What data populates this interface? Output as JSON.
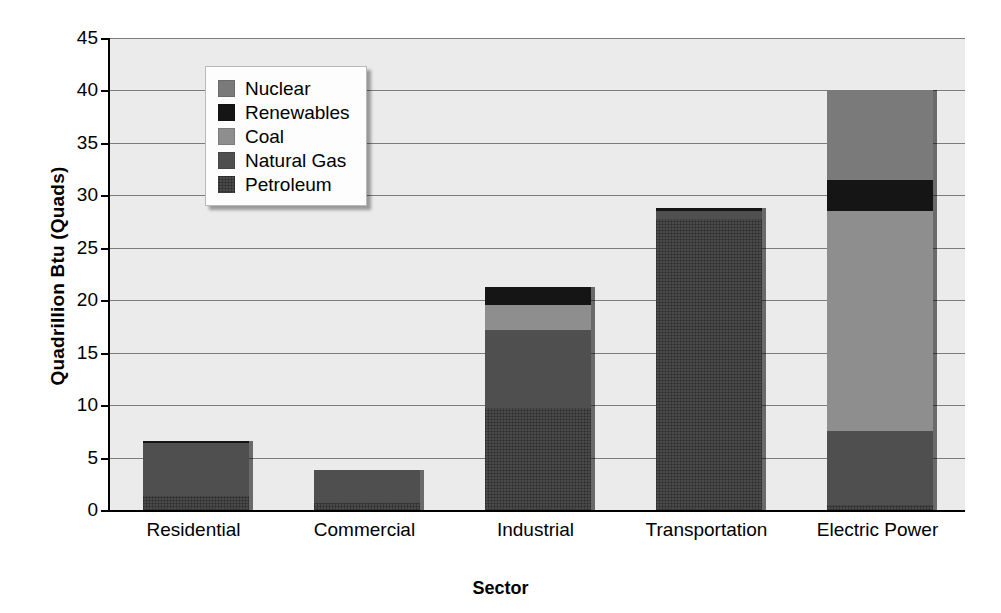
{
  "chart_data": {
    "type": "bar",
    "stacked": true,
    "title": "",
    "xlabel": "Sector",
    "ylabel": "Quadrillion Btu (Quads)",
    "ylim": [
      0,
      45
    ],
    "ytick_labels": [
      "45",
      "40",
      "35",
      "30",
      "25",
      "20",
      "15",
      "10",
      "5",
      "0"
    ],
    "ytick_values": [
      45,
      40,
      35,
      30,
      25,
      20,
      15,
      10,
      5,
      0
    ],
    "grid": "horizontal",
    "legend_position": "upper-left-inside",
    "categories": [
      "Residential",
      "Commercial",
      "Industrial",
      "Transportation",
      "Electric Power"
    ],
    "series": [
      {
        "name": "Petroleum",
        "color": "#4a4a4a",
        "values": [
          1.3,
          0.7,
          9.7,
          27.7,
          0.5
        ]
      },
      {
        "name": "Natural Gas",
        "color": "#4f4f4f",
        "values": [
          5.1,
          3.1,
          7.5,
          0.8,
          7.0
        ]
      },
      {
        "name": "Coal",
        "color": "#8e8e8e",
        "values": [
          0.0,
          0.0,
          2.3,
          0.0,
          21.0
        ]
      },
      {
        "name": "Renewables",
        "color": "#151515",
        "values": [
          0.2,
          0.0,
          1.8,
          0.3,
          3.0
        ]
      },
      {
        "name": "Nuclear",
        "color": "#7a7a7a",
        "values": [
          0.0,
          0.0,
          0.0,
          0.0,
          8.5
        ]
      }
    ],
    "totals": [
      6.6,
      3.8,
      21.3,
      28.8,
      40.0
    ]
  },
  "legend": {
    "entries": [
      {
        "label": "Nuclear",
        "color": "#7a7a7a",
        "swatch": "nuclear-swatch"
      },
      {
        "label": "Renewables",
        "color": "#151515",
        "swatch": "renewables-swatch"
      },
      {
        "label": "Coal",
        "color": "#8e8e8e",
        "swatch": "coal-swatch"
      },
      {
        "label": "Natural Gas",
        "color": "#4f4f4f",
        "swatch": "natural-gas-swatch"
      },
      {
        "label": "Petroleum",
        "color": "#4a4a4a",
        "swatch": "petroleum-swatch"
      }
    ]
  }
}
